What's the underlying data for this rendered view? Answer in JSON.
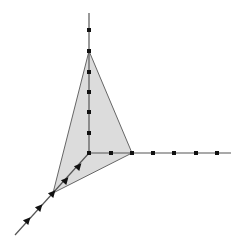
{
  "diagram": {
    "type": "3d-coordinate-axes-with-simplex",
    "colors": {
      "background": "#ffffff",
      "axis": "#555555",
      "face_fill": "#dcdcdc",
      "face_stroke": "#666666",
      "marker": "#111111"
    },
    "origin": [
      89,
      153
    ],
    "axes": [
      {
        "name": "z-axis",
        "from": [
          89,
          153
        ],
        "to": [
          89,
          13
        ],
        "marker": "dot",
        "ticks": [
          [
            89,
            133
          ],
          [
            89,
            112
          ],
          [
            89,
            92
          ],
          [
            89,
            72
          ],
          [
            89,
            51
          ],
          [
            89,
            30
          ]
        ]
      },
      {
        "name": "x-axis",
        "from": [
          89,
          153
        ],
        "to": [
          231,
          153
        ],
        "marker": "dot",
        "ticks": [
          [
            111,
            153
          ],
          [
            132,
            153
          ],
          [
            153,
            153
          ],
          [
            174,
            153
          ],
          [
            196,
            153
          ],
          [
            217,
            153
          ]
        ]
      },
      {
        "name": "y-axis",
        "from": [
          89,
          153
        ],
        "to": [
          15,
          235
        ],
        "marker": "triangle",
        "ticks": [
          [
            79,
            166
          ],
          [
            66,
            180
          ],
          [
            53,
            193
          ],
          [
            40,
            207
          ],
          [
            28,
            220
          ]
        ]
      }
    ],
    "origin_marker": [
      89,
      153
    ],
    "simplex_face": {
      "vertices": [
        [
          89,
          51
        ],
        [
          132,
          153
        ],
        [
          53,
          193
        ]
      ]
    }
  }
}
